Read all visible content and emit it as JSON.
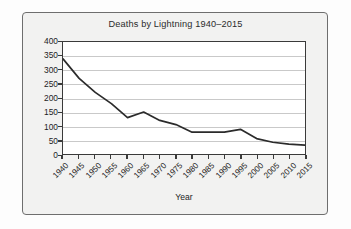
{
  "chart_data": {
    "type": "line",
    "title": "Deaths by Lightning 1940–2015",
    "xlabel": "Year",
    "ylabel": "",
    "categories": [
      "1940",
      "1945",
      "1950",
      "1955",
      "1960",
      "1965",
      "1970",
      "1975",
      "1980",
      "1985",
      "1990",
      "1995",
      "2000",
      "2005",
      "2010",
      "2015"
    ],
    "x": [
      1940,
      1945,
      1950,
      1955,
      1960,
      1965,
      1970,
      1975,
      1980,
      1985,
      1990,
      1995,
      2000,
      2005,
      2010,
      2015
    ],
    "values": [
      340,
      270,
      220,
      180,
      130,
      150,
      120,
      105,
      78,
      78,
      78,
      88,
      55,
      42,
      35,
      32
    ],
    "series": [
      {
        "name": "Deaths by Lightning",
        "values": [
          340,
          270,
          220,
          180,
          130,
          150,
          120,
          105,
          78,
          78,
          78,
          88,
          55,
          42,
          35,
          32
        ]
      }
    ],
    "ylim": [
      0,
      400
    ],
    "ytick_labels": [
      "400",
      "350",
      "300",
      "250",
      "200",
      "150",
      "100",
      "50",
      "0"
    ],
    "ytick_values": [
      400,
      350,
      300,
      250,
      200,
      150,
      100,
      50,
      0
    ],
    "xlim": [
      1940,
      2015
    ],
    "grid": "horizontal",
    "legend": "none",
    "line_color": "#2b2b2b",
    "plot_background": "#ffffff",
    "gridline_color": "#c9c9c9",
    "card_background": "#f2f2f1",
    "axis_color": "#3a3a3a"
  },
  "axis_titles": {
    "x": "Year"
  }
}
